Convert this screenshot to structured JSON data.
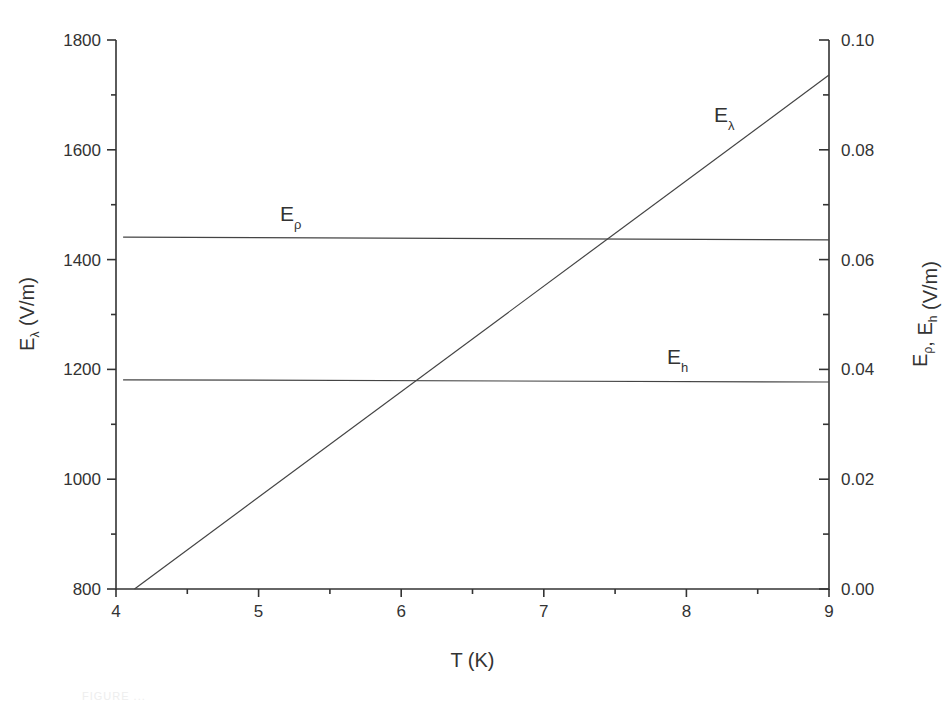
{
  "chart_data": {
    "type": "line",
    "title": "",
    "xlabel": "T (K)",
    "ylabel_left": {
      "main": "E",
      "sub": "λ",
      "unit": " (V/m)"
    },
    "ylabel_right": {
      "parts": [
        {
          "main": "E",
          "sub": "ρ"
        },
        {
          "main": ", E",
          "sub": "h"
        }
      ],
      "unit": " (V/m)"
    },
    "xlim": [
      4,
      9
    ],
    "ylim_left": [
      800,
      1800
    ],
    "ylim_right": [
      0.0,
      0.1
    ],
    "x_ticks": [
      "4",
      "5",
      "6",
      "7",
      "8",
      "9"
    ],
    "y_left_ticks": [
      "800",
      "1000",
      "1200",
      "1400",
      "1600",
      "1800"
    ],
    "y_right_ticks": [
      "0.00",
      "0.02",
      "0.04",
      "0.06",
      "0.08",
      "0.10"
    ],
    "grid": false,
    "legend": "inline labels",
    "series": [
      {
        "name": "E_λ",
        "label_main": "E",
        "label_sub": "λ",
        "axis": "left",
        "x": [
          4.13,
          9.0
        ],
        "values": [
          800,
          1736
        ]
      },
      {
        "name": "E_ρ",
        "label_main": "E",
        "label_sub": "ρ",
        "axis": "right",
        "x": [
          4.05,
          9.0
        ],
        "values": [
          0.0641,
          0.0636
        ]
      },
      {
        "name": "E_h",
        "label_main": "E",
        "label_sub": "h",
        "axis": "right",
        "x": [
          4.05,
          9.0
        ],
        "values": [
          0.0381,
          0.0377
        ]
      }
    ]
  },
  "caption_fragment": "FIGURE ..."
}
